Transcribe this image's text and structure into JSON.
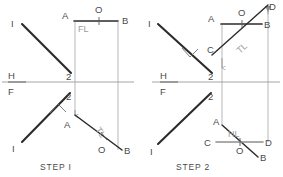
{
  "figure": {
    "type": "orthographic-projection-diagram",
    "background_color": "#ffffff",
    "line_color_dark": "#1a1a1a",
    "line_color_light": "#9a9a9a",
    "text_color": "#4a4a4a",
    "panels": [
      {
        "id": "step-1",
        "caption": "STEP I",
        "caption_pos": {
          "x": 44,
          "y": 168
        },
        "fold_line": {
          "label_upper": "H",
          "label_lower": "F",
          "label_upper_pos": {
            "x": 8,
            "y": 76
          },
          "label_lower_pos": {
            "x": 8,
            "y": 95
          },
          "y": 82,
          "x1": 2,
          "x2": 134
        },
        "top_view": {
          "line_1_2": {
            "label_start": "I",
            "label_end": "2",
            "start": {
              "x": 22,
              "y": 24
            },
            "end": {
              "x": 71,
              "y": 73
            },
            "label_start_pos": {
              "x": 12,
              "y": 27
            },
            "label_end_pos": {
              "x": 67,
              "y": 78
            }
          },
          "line_AB": {
            "label_start": "A",
            "label_end": "B",
            "label_mid": "O",
            "start": {
              "x": 75,
              "y": 21
            },
            "end": {
              "x": 118,
              "y": 21
            },
            "label_start_pos": {
              "x": 64,
              "y": 17
            },
            "label_end_pos": {
              "x": 123,
              "y": 23
            },
            "label_mid_pos": {
              "x": 98,
              "y": 13
            }
          },
          "fold_label": {
            "text": "FL",
            "x": 80,
            "y": 31
          }
        },
        "front_view": {
          "line_1_2": {
            "label_start": "I",
            "label_end": "2",
            "start": {
              "x": 22,
              "y": 142
            },
            "end": {
              "x": 70,
              "y": 93
            },
            "label_start_pos": {
              "x": 13,
              "y": 150
            },
            "label_end_pos": {
              "x": 67,
              "y": 98
            }
          },
          "line_AB": {
            "label_start": "A",
            "label_end": "B",
            "label_mid": "O",
            "start": {
              "x": 75,
              "y": 115
            },
            "end": {
              "x": 122,
              "y": 150
            },
            "label_start_pos": {
              "x": 66,
              "y": 125
            },
            "label_end_pos": {
              "x": 126,
              "y": 152
            },
            "label_mid_pos": {
              "x": 102,
              "y": 150
            }
          },
          "true_length_label": {
            "text": "TL",
            "x": 98,
            "y": 126,
            "rotation": 53
          },
          "perpendicular_mark": true
        },
        "projectors": [
          {
            "name": "projector-A",
            "x": 75,
            "y1": 21,
            "y2": 115
          },
          {
            "name": "projector-B",
            "x": 118,
            "y1": 21,
            "y2": 150
          }
        ]
      },
      {
        "id": "step-2",
        "caption": "STEP 2",
        "caption_pos": {
          "x": 180,
          "y": 168
        },
        "fold_line": {
          "label_upper": "H",
          "label_lower": "F",
          "label_upper_pos": {
            "x": 160,
            "y": 76
          },
          "label_lower_pos": {
            "x": 160,
            "y": 95
          },
          "y": 82,
          "x1": 152,
          "x2": 280
        },
        "top_view": {
          "line_1_2": {
            "label_start": "I",
            "label_end": "2",
            "start": {
              "x": 158,
              "y": 24
            },
            "end": {
              "x": 212,
              "y": 73
            },
            "label_start_pos": {
              "x": 150,
              "y": 27
            },
            "label_end_pos": {
              "x": 210,
              "y": 78
            }
          },
          "line_AB": {
            "label_start": "A",
            "label_end": "B",
            "label_mid": "O",
            "start": {
              "x": 222,
              "y": 24
            },
            "end": {
              "x": 262,
              "y": 24
            },
            "label_start_pos": {
              "x": 212,
              "y": 21
            },
            "label_end_pos": {
              "x": 266,
              "y": 27
            },
            "label_mid_pos": {
              "x": 238,
              "y": 17
            }
          },
          "line_CD": {
            "label_start": "C",
            "label_end": "D",
            "start": {
              "x": 212,
              "y": 53
            },
            "end": {
              "x": 268,
              "y": 4
            },
            "label_start_pos": {
              "x": 212,
              "y": 52
            },
            "label_end_pos": {
              "x": 270,
              "y": 9
            }
          },
          "true_length_label": {
            "text": "TL",
            "x": 243,
            "y": 50,
            "rotation": -42
          },
          "perpendicular_mark": true
        },
        "front_view": {
          "line_1_2": {
            "label_start": "I",
            "label_end": "2",
            "start": {
              "x": 158,
              "y": 144
            },
            "end": {
              "x": 211,
              "y": 93
            },
            "label_start_pos": {
              "x": 152,
              "y": 153
            },
            "label_end_pos": {
              "x": 210,
              "y": 98
            }
          },
          "line_AB": {
            "label_start": "A",
            "label_end": "B",
            "label_mid": "O",
            "start": {
              "x": 222,
              "y": 125
            },
            "end": {
              "x": 258,
              "y": 157
            },
            "label_start_pos": {
              "x": 214,
              "y": 124
            },
            "label_end_pos": {
              "x": 262,
              "y": 159
            },
            "label_mid_pos": {
              "x": 238,
              "y": 152
            }
          },
          "line_CD": {
            "label_start": "C",
            "label_end": "D",
            "start": {
              "x": 216,
              "y": 142
            },
            "end": {
              "x": 262,
              "y": 142
            },
            "label_start_pos": {
              "x": 206,
              "y": 145
            },
            "label_end_pos": {
              "x": 266,
              "y": 145
            }
          },
          "horizontal_label": {
            "text": "HL",
            "x": 232,
            "y": 136
          }
        },
        "projectors": [
          {
            "name": "projector-A",
            "x": 222,
            "y1": 24,
            "y2": 125
          },
          {
            "name": "projector-D",
            "x": 268,
            "y1": 4,
            "y2": 142
          }
        ]
      }
    ]
  }
}
